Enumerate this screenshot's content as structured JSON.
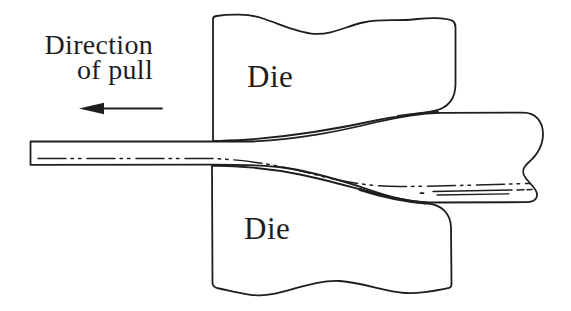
{
  "figure": {
    "labels": {
      "direction_line1": "Direction",
      "direction_line2": "of pull",
      "upper_die": "Die",
      "lower_die": "Die"
    },
    "icons": {
      "pull_arrow_icon": "left-arrow"
    },
    "colors": {
      "ink": "#1e1e1e",
      "background": "#ffffff"
    }
  }
}
